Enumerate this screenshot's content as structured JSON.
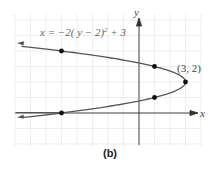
{
  "chart_data": {
    "type": "line",
    "title": "",
    "equation": "x = -2( y - 2)² + 3",
    "xlabel": "x",
    "ylabel": "y",
    "grid": true,
    "xlim": [
      -8,
      4
    ],
    "ylim": [
      -2,
      6
    ],
    "vertex": {
      "x": 3,
      "y": 2,
      "label": "(3, 2)"
    },
    "points": [
      {
        "x": -5,
        "y": 4
      },
      {
        "x": 1,
        "y": 3
      },
      {
        "x": 3,
        "y": 2
      },
      {
        "x": 1,
        "y": 1
      },
      {
        "x": -5,
        "y": 0
      }
    ],
    "caption": "(b)"
  },
  "labels": {
    "equation_prefix": "x = −2( y − 2)",
    "equation_exp": "2",
    "equation_suffix": " + 3",
    "vertex": "(3, 2)",
    "x_axis": "x",
    "y_axis": "y",
    "caption": "(b)"
  }
}
